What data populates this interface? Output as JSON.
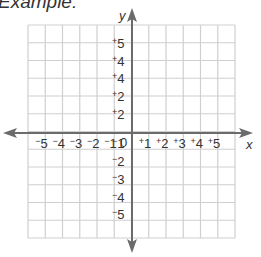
{
  "heading": "Example:",
  "axes": {
    "x_label": "x",
    "y_label": "y"
  },
  "grid": {
    "cols": 12,
    "rows": 12,
    "origin_label": "0",
    "x_tick_labels": [
      {
        "sign": "−",
        "value": "5"
      },
      {
        "sign": "−",
        "value": "4"
      },
      {
        "sign": "−",
        "value": "3"
      },
      {
        "sign": "−",
        "value": "2"
      },
      {
        "sign": "−",
        "value": "1"
      },
      {
        "sign": "+",
        "value": "1"
      },
      {
        "sign": "+",
        "value": "2"
      },
      {
        "sign": "+",
        "value": "3"
      },
      {
        "sign": "+",
        "value": "4"
      },
      {
        "sign": "+",
        "value": "5"
      }
    ],
    "y_tick_labels_positive": [
      {
        "sign": "+",
        "value": "5"
      },
      {
        "sign": "+",
        "value": "4"
      },
      {
        "sign": "+",
        "value": "4"
      },
      {
        "sign": "+",
        "value": "2"
      },
      {
        "sign": "+",
        "value": "2"
      }
    ],
    "y_tick_labels_negative": [
      {
        "sign": "−",
        "value": "1"
      },
      {
        "sign": "−",
        "value": "2"
      },
      {
        "sign": "−",
        "value": "3"
      },
      {
        "sign": "−",
        "value": "4"
      },
      {
        "sign": "−",
        "value": "5"
      }
    ]
  },
  "colors": {
    "gridline": "#cfcfcf",
    "axis": "#6b6b6b",
    "text": "#333333"
  }
}
